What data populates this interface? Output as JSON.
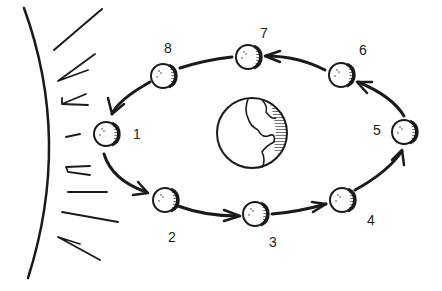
{
  "diagram": {
    "type": "moon-phases-orbit",
    "colors": {
      "ink": "#1a1a1a",
      "background": "#ffffff"
    },
    "sun": {
      "name": "sun-edge",
      "rays": 8
    },
    "earth": {
      "name": "earth",
      "cx": 252,
      "cy": 133,
      "r": 35
    },
    "moons": [
      {
        "label": "1",
        "cx": 106,
        "cy": 134,
        "lx": 137,
        "ly": 134
      },
      {
        "label": "2",
        "cx": 165,
        "cy": 200,
        "lx": 172,
        "ly": 237
      },
      {
        "label": "3",
        "cx": 255,
        "cy": 214,
        "lx": 273,
        "ly": 242
      },
      {
        "label": "4",
        "cx": 342,
        "cy": 200,
        "lx": 371,
        "ly": 220
      },
      {
        "label": "5",
        "cx": 404,
        "cy": 132,
        "lx": 377,
        "ly": 130
      },
      {
        "label": "6",
        "cx": 341,
        "cy": 75,
        "lx": 363,
        "ly": 50
      },
      {
        "label": "7",
        "cx": 248,
        "cy": 57,
        "lx": 264,
        "ly": 33
      },
      {
        "label": "8",
        "cx": 163,
        "cy": 76,
        "lx": 168,
        "ly": 48
      }
    ],
    "orbit_direction": "counterclockwise"
  }
}
